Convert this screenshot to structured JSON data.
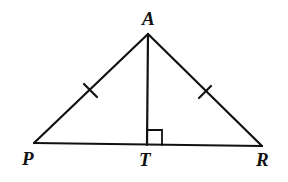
{
  "diagram": {
    "type": "isosceles-triangle-with-altitude",
    "points": {
      "A": {
        "label": "A",
        "x": 148,
        "y": 34
      },
      "P": {
        "label": "P",
        "x": 34,
        "y": 143
      },
      "T": {
        "label": "T",
        "x": 147,
        "y": 145
      },
      "R": {
        "label": "R",
        "x": 262,
        "y": 146
      }
    },
    "segments": [
      "AP",
      "AR",
      "PR",
      "AT"
    ],
    "congruent_marks": [
      "AP",
      "AR"
    ],
    "right_angle_at": "T",
    "stroke_color": "#111111"
  }
}
